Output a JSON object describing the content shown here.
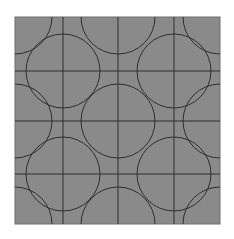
{
  "figure": {
    "background": "#ffffff",
    "panel": {
      "x": 15,
      "y": 17,
      "width": 205,
      "height": 207,
      "fill": "#8a8a8a",
      "stroke": "#6e6e6e"
    },
    "line_color": "#2e2e2e",
    "grid": {
      "vertical_x": [
        63,
        118,
        174
      ],
      "horizontal_y": [
        71,
        121,
        174
      ]
    },
    "circle_radius": 37,
    "circles": [
      {
        "cx": 63,
        "cy": 71
      },
      {
        "cx": 174,
        "cy": 71
      },
      {
        "cx": 118,
        "cy": 121
      },
      {
        "cx": 63,
        "cy": 174
      },
      {
        "cx": 174,
        "cy": 174
      },
      {
        "cx": 118,
        "cy": 17
      },
      {
        "cx": 118,
        "cy": 224
      },
      {
        "cx": 15,
        "cy": 121
      },
      {
        "cx": 220,
        "cy": 121
      },
      {
        "cx": 15,
        "cy": 17
      },
      {
        "cx": 220,
        "cy": 17
      },
      {
        "cx": 15,
        "cy": 224
      },
      {
        "cx": 220,
        "cy": 224
      }
    ]
  }
}
